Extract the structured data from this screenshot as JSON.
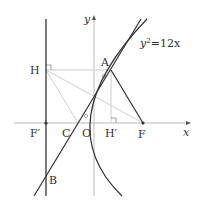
{
  "figure": {
    "type": "parabola-focus-directrix",
    "equation_label": "y²=12x",
    "equation_base": "y",
    "equation_exp": "2",
    "equation_rest": "=12x",
    "axis_labels": {
      "x": "x",
      "y": "y"
    },
    "points": {
      "A": {
        "label": "A",
        "px": [
          111,
          70
        ]
      },
      "B": {
        "label": "B",
        "px": [
          46,
          176
        ]
      },
      "C": {
        "label": "C",
        "px": [
          78,
          123
        ]
      },
      "O": {
        "label": "O",
        "px": [
          94,
          123
        ]
      },
      "F": {
        "label": "F",
        "px": [
          143,
          123
        ]
      },
      "F_prime": {
        "label": "F′",
        "px": [
          46,
          123
        ]
      },
      "H": {
        "label": "H",
        "px": [
          46,
          70
        ]
      },
      "H_prime": {
        "label": "H′",
        "px": [
          111,
          123
        ]
      }
    },
    "colors": {
      "main_line": "#333333",
      "axis": "#bbbbbb",
      "aux_line": "#cccccc",
      "text": "#333333"
    }
  }
}
